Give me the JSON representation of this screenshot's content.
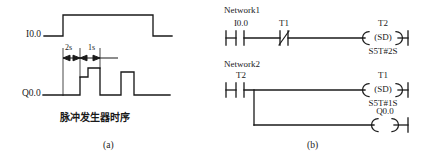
{
  "figure": {
    "subfigures": [
      {
        "id": "a",
        "label": "(a)",
        "caption": "脉冲发生器时序"
      },
      {
        "id": "b",
        "label": "(b)",
        "caption": ""
      }
    ]
  },
  "timing_diagram": {
    "name": "pulse-generator-timing",
    "caption": "脉冲发生器时序",
    "sublabel": "(a)",
    "signals": [
      {
        "name": "input-signal",
        "label": "I0.0"
      },
      {
        "name": "output-signal",
        "label": "Q0.0"
      }
    ],
    "dimensions": [
      {
        "name": "interval-2s",
        "label": "2s"
      },
      {
        "name": "interval-1s",
        "label": "1s"
      }
    ],
    "line_color": "#1a1a1a"
  },
  "ladder_diagram": {
    "name": "plc-ladder-logic",
    "sublabel": "(b)",
    "networks": [
      {
        "title": "Network1",
        "contacts": [
          {
            "label": "I0.0",
            "type": "normally-open"
          },
          {
            "label": "T1",
            "type": "normally-closed"
          }
        ],
        "outputs": [
          {
            "label": "T2",
            "coil": "(SD)",
            "preset": "S5T#2S"
          }
        ]
      },
      {
        "title": "Network2",
        "contacts": [
          {
            "label": "T2",
            "type": "normally-open"
          }
        ],
        "outputs": [
          {
            "label": "T1",
            "coil": "(SD)",
            "preset": "S5T#1S"
          },
          {
            "label": "Q0.0",
            "coil": "(  )",
            "preset": ""
          }
        ]
      }
    ],
    "line_color": "#1a1a1a"
  }
}
